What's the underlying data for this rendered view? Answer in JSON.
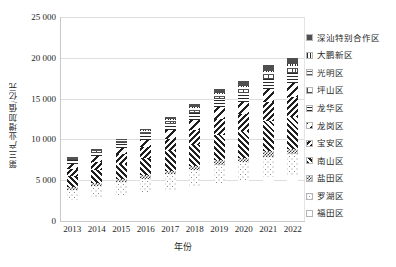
{
  "chart_data": {
    "type": "bar",
    "subtype": "stacked-bar",
    "title": "",
    "xlabel": "年份",
    "ylabel": "第三产业增加值/亿元",
    "categories": [
      "2013",
      "2014",
      "2015",
      "2016",
      "2017",
      "2018",
      "2019",
      "2020",
      "2021",
      "2022"
    ],
    "ylim": [
      0,
      25000
    ],
    "yticks": [
      0,
      5000,
      10000,
      15000,
      20000,
      25000
    ],
    "ytick_labels": [
      "0",
      "5 000",
      "10 000",
      "15 000",
      "20 000",
      "25 000"
    ],
    "grid": true,
    "legend_position": "right",
    "totals": [
      7800,
      8800,
      10100,
      11300,
      12700,
      14200,
      16200,
      17100,
      19100,
      20000
    ],
    "series": [
      {
        "name": "福田区",
        "pattern": "sparse-dots",
        "values": [
          2550,
          2850,
          3200,
          3500,
          3850,
          4250,
          4700,
          4900,
          5400,
          5600
        ]
      },
      {
        "name": "罗湖区",
        "pattern": "dots",
        "values": [
          1250,
          1400,
          1550,
          1700,
          1850,
          2000,
          2200,
          2300,
          2500,
          2600
        ]
      },
      {
        "name": "盐田区",
        "pattern": "checker",
        "values": [
          330,
          360,
          400,
          430,
          470,
          510,
          560,
          580,
          640,
          660
        ]
      },
      {
        "name": "南山区",
        "pattern": "diag-fwd",
        "values": [
          1400,
          1600,
          1850,
          2100,
          2400,
          2700,
          3100,
          3300,
          3700,
          3900
        ]
      },
      {
        "name": "宝安区",
        "pattern": "diag-back",
        "values": [
          880,
          1000,
          1150,
          1300,
          1500,
          1700,
          1950,
          2050,
          2300,
          2400
        ]
      },
      {
        "name": "龙岗区",
        "pattern": "diag-wide-back",
        "values": [
          620,
          700,
          820,
          930,
          1070,
          1210,
          1400,
          1480,
          1680,
          1760
        ]
      },
      {
        "name": "龙华区",
        "pattern": "hlines",
        "values": [
          420,
          480,
          560,
          640,
          740,
          840,
          980,
          1040,
          1180,
          1240
        ]
      },
      {
        "name": "坪山区",
        "pattern": "grid-small",
        "values": [
          150,
          175,
          205,
          235,
          270,
          310,
          360,
          380,
          440,
          460
        ]
      },
      {
        "name": "光明区",
        "pattern": "hlines-thin",
        "values": [
          130,
          150,
          180,
          205,
          240,
          275,
          320,
          340,
          390,
          410
        ]
      },
      {
        "name": "大鹏新区",
        "pattern": "vlines",
        "values": [
          60,
          70,
          80,
          95,
          110,
          125,
          145,
          155,
          180,
          190
        ]
      },
      {
        "name": "深汕特别合作区",
        "pattern": "solid-dark",
        "values": [
          10,
          15,
          105,
          165,
          300,
          380,
          485,
          575,
          690,
          784
        ]
      }
    ]
  },
  "legend": {
    "items": [
      {
        "label": "深汕特别合作区",
        "pattern": "solid-dark"
      },
      {
        "label": "大鹏新区",
        "pattern": "vlines"
      },
      {
        "label": "光明区",
        "pattern": "hlines-thin"
      },
      {
        "label": "坪山区",
        "pattern": "grid-small"
      },
      {
        "label": "龙华区",
        "pattern": "hlines"
      },
      {
        "label": "龙岗区",
        "pattern": "diag-wide-back"
      },
      {
        "label": "宝安区",
        "pattern": "diag-back"
      },
      {
        "label": "南山区",
        "pattern": "diag-fwd"
      },
      {
        "label": "盐田区",
        "pattern": "checker"
      },
      {
        "label": "罗湖区",
        "pattern": "dots"
      },
      {
        "label": "福田区",
        "pattern": "sparse-dots"
      }
    ]
  }
}
